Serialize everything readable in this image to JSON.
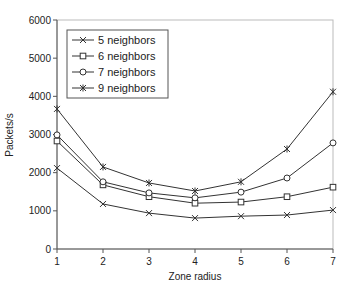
{
  "chart_data": {
    "type": "line",
    "title": "",
    "xlabel": "Zone radius",
    "ylabel": "Packets/s",
    "x": [
      1,
      2,
      3,
      4,
      5,
      6,
      7
    ],
    "xlim": [
      1,
      7
    ],
    "ylim": [
      0,
      6000
    ],
    "yticks": [
      0,
      1000,
      2000,
      3000,
      4000,
      5000,
      6000
    ],
    "xticks": [
      1,
      2,
      3,
      4,
      5,
      6,
      7
    ],
    "grid": false,
    "legend_position": "upper-left-inside",
    "series": [
      {
        "name": "5 neighbors",
        "marker": "x",
        "values": [
          2120,
          1180,
          940,
          810,
          860,
          890,
          1020
        ]
      },
      {
        "name": "6 neighbors",
        "marker": "square",
        "values": [
          2830,
          1680,
          1370,
          1200,
          1230,
          1370,
          1620
        ]
      },
      {
        "name": "7 neighbors",
        "marker": "circle",
        "values": [
          2990,
          1760,
          1470,
          1340,
          1490,
          1860,
          2780
        ]
      },
      {
        "name": "9 neighbors",
        "marker": "star",
        "values": [
          3670,
          2150,
          1730,
          1520,
          1760,
          2620,
          4120
        ]
      }
    ]
  },
  "colors": {
    "line": "#333333",
    "axis": "#555555",
    "frame": "#bbbbbb"
  }
}
